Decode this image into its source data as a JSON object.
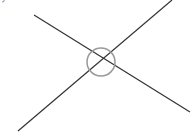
{
  "diagram": {
    "type": "crossing-lines-with-circle",
    "top_label_fragment": "ア",
    "colors": {
      "line": "#333333",
      "circle": "#999999",
      "background": "#ffffff",
      "label": "#777777"
    },
    "lines": [
      {
        "x1": 34,
        "y1": 15,
        "x2": 190,
        "y2": 112
      },
      {
        "x1": 172,
        "y1": 0,
        "x2": 18,
        "y2": 131
      }
    ],
    "circle": {
      "cx": 101,
      "cy": 62,
      "r": 14
    }
  }
}
